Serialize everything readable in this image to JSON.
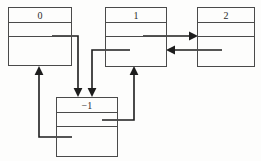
{
  "diagram": {
    "type": "node-link-diagram",
    "title": "",
    "background_color": "#fdfdfc",
    "stroke_color": "#1d1d1d",
    "box_border_color": "#4a4a4a",
    "label_color": "#2b2b2b",
    "nodes": [
      {
        "id": "node-0",
        "label": "0",
        "x": 8,
        "y": 7,
        "width": 64,
        "height": 59,
        "rows": 3,
        "row_heights": [
          15,
          15,
          29
        ]
      },
      {
        "id": "node-1",
        "label": "1",
        "x": 105,
        "y": 7,
        "width": 62,
        "height": 60,
        "rows": 3,
        "row_heights": [
          15,
          15,
          30
        ]
      },
      {
        "id": "node-2",
        "label": "2",
        "x": 197,
        "y": 7,
        "width": 58,
        "height": 60,
        "rows": 3,
        "row_heights": [
          15,
          15,
          30
        ]
      },
      {
        "id": "node-minus-1",
        "label": "−1",
        "x": 56,
        "y": 97,
        "width": 62,
        "height": 60,
        "rows": 3,
        "row_heights": [
          15,
          15,
          30
        ]
      }
    ],
    "edges": [
      {
        "id": "edge-0-to-minus1",
        "from": "node-0",
        "to": "node-minus-1",
        "from_row": 2,
        "to_side": "top",
        "points": "52,36 78,36 78,93",
        "arrow": "down",
        "arrow_x": 78,
        "arrow_y": 96
      },
      {
        "id": "edge-1-to-minus1",
        "from": "node-1",
        "to": "node-minus-1",
        "from_row": 3,
        "to_side": "top",
        "points": "130,50 92,50 92,93",
        "arrow": "down",
        "arrow_x": 92,
        "arrow_y": 96
      },
      {
        "id": "edge-1-to-2",
        "from": "node-1",
        "to": "node-2",
        "from_row": 2,
        "to_side": "left",
        "points": "143,36 194,36",
        "arrow": "right",
        "arrow_x": 197,
        "arrow_y": 36
      },
      {
        "id": "edge-2-to-1",
        "from": "node-2",
        "to": "node-1",
        "from_row": 3,
        "to_side": "right",
        "points": "222,50 170,50",
        "arrow": "left",
        "arrow_x": 167,
        "arrow_y": 50
      },
      {
        "id": "edge-minus1-to-1",
        "from": "node-minus-1",
        "to": "node-1",
        "from_row": 2,
        "to_side": "bottom",
        "points": "102,120 134,120 134,71",
        "arrow": "up",
        "arrow_x": 134,
        "arrow_y": 68
      },
      {
        "id": "edge-minus1-to-0",
        "from": "node-minus-1",
        "to": "node-0",
        "from_row": 3,
        "to_side": "bottom",
        "points": "72,137 39,137 39,70",
        "arrow": "up",
        "arrow_x": 39,
        "arrow_y": 67
      }
    ]
  }
}
